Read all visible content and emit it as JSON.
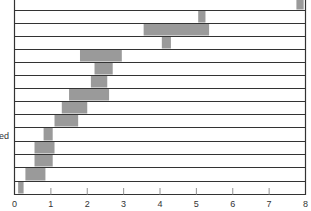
{
  "chart_data": {
    "type": "bar",
    "subtype": "floating-horizontal-range",
    "title": "",
    "xlabel": "",
    "ylabel": "",
    "side_label_fragment": "ed",
    "xlim": [
      0,
      8
    ],
    "xticks": [
      "0",
      "1",
      "2",
      "3",
      "4",
      "5",
      "6",
      "7",
      "8"
    ],
    "grid": false,
    "bar_color": "#9a9a9a",
    "rows": [
      {
        "start": 7.75,
        "end": 7.95
      },
      {
        "start": 5.05,
        "end": 5.25
      },
      {
        "start": 3.55,
        "end": 5.35
      },
      {
        "start": 4.05,
        "end": 4.3
      },
      {
        "start": 1.8,
        "end": 2.95
      },
      {
        "start": 2.2,
        "end": 2.7
      },
      {
        "start": 2.1,
        "end": 2.55
      },
      {
        "start": 1.5,
        "end": 2.6
      },
      {
        "start": 1.3,
        "end": 2.0
      },
      {
        "start": 1.1,
        "end": 1.75
      },
      {
        "start": 0.8,
        "end": 1.05
      },
      {
        "start": 0.55,
        "end": 1.1
      },
      {
        "start": 0.55,
        "end": 1.05
      },
      {
        "start": 0.3,
        "end": 0.85
      },
      {
        "start": 0.1,
        "end": 0.25
      }
    ]
  }
}
